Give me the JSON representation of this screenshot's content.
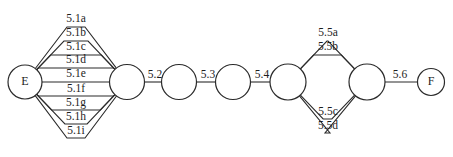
{
  "diagram": {
    "type": "activity-network-diagram",
    "background_color": "#ffffff",
    "line_color": "#2b2b2b",
    "text_color": "#1d1d1d",
    "width": 453,
    "height": 157,
    "nodes": [
      {
        "id": "E",
        "label": "E",
        "cx": 25,
        "cy": 82,
        "r": 17,
        "kind": "terminal"
      },
      {
        "id": "n1",
        "label": "",
        "cx": 127,
        "cy": 82,
        "r": 17.5,
        "kind": "junction"
      },
      {
        "id": "n2",
        "label": "",
        "cx": 179,
        "cy": 82,
        "r": 17.5,
        "kind": "junction"
      },
      {
        "id": "n3",
        "label": "",
        "cx": 233,
        "cy": 82,
        "r": 17.5,
        "kind": "junction"
      },
      {
        "id": "n4",
        "label": "",
        "cx": 288,
        "cy": 82,
        "r": 18,
        "kind": "junction"
      },
      {
        "id": "n5",
        "label": "",
        "cx": 367,
        "cy": 82,
        "r": 18,
        "kind": "junction"
      },
      {
        "id": "F",
        "label": "F",
        "cx": 431,
        "cy": 82,
        "r": 13.5,
        "kind": "terminal"
      }
    ],
    "edge_groups": [
      {
        "name": "group-5-1",
        "from": "E",
        "to": "n1",
        "orientation": "parallel-fan",
        "edges": [
          {
            "label": "5.1a",
            "label_x": 76,
            "label_y": 22,
            "run_y": 27,
            "side": "above"
          },
          {
            "label": "5.1b",
            "label_x": 76,
            "label_y": 36,
            "run_y": 41,
            "side": "above"
          },
          {
            "label": "5.1c",
            "label_x": 76,
            "label_y": 50,
            "run_y": 55,
            "side": "above"
          },
          {
            "label": "5.1d",
            "label_x": 76,
            "label_y": 63,
            "run_y": 68,
            "side": "above"
          },
          {
            "label": "5.1e",
            "label_x": 76,
            "label_y": 77,
            "run_y": 82,
            "side": "center"
          },
          {
            "label": "5.1f",
            "label_x": 76,
            "label_y": 92,
            "run_y": 96,
            "side": "below"
          },
          {
            "label": "5.1g",
            "label_x": 76,
            "label_y": 106,
            "run_y": 110,
            "side": "below"
          },
          {
            "label": "5.1h",
            "label_x": 76,
            "label_y": 120,
            "run_y": 124,
            "side": "below"
          },
          {
            "label": "5.1i",
            "label_x": 76,
            "label_y": 134,
            "run_y": 138,
            "side": "below"
          }
        ]
      },
      {
        "name": "chain-5-2",
        "from": "n1",
        "to": "n2",
        "orientation": "straight",
        "edges": [
          {
            "label": "5.2",
            "label_x": 155,
            "label_y": 78,
            "run_y": 82,
            "side": "center"
          }
        ]
      },
      {
        "name": "chain-5-3",
        "from": "n2",
        "to": "n3",
        "orientation": "straight",
        "edges": [
          {
            "label": "5.3",
            "label_x": 208,
            "label_y": 78,
            "run_y": 82,
            "side": "center"
          }
        ]
      },
      {
        "name": "chain-5-4",
        "from": "n3",
        "to": "n4",
        "orientation": "straight",
        "edges": [
          {
            "label": "5.4",
            "label_x": 262,
            "label_y": 78,
            "run_y": 82,
            "side": "center"
          }
        ]
      },
      {
        "name": "group-5-5",
        "from": "n4",
        "to": "n5",
        "orientation": "parallel-fan",
        "edges": [
          {
            "label": "5.5a",
            "label_x": 328,
            "label_y": 36,
            "run_y": 41,
            "side": "above"
          },
          {
            "label": "5.5b",
            "label_x": 328,
            "label_y": 50,
            "run_y": 55,
            "side": "above"
          },
          {
            "label": "5.5c",
            "label_x": 328,
            "label_y": 115,
            "run_y": 119,
            "side": "below"
          },
          {
            "label": "5.5d",
            "label_x": 328,
            "label_y": 129,
            "run_y": 133,
            "side": "below"
          }
        ]
      },
      {
        "name": "chain-5-6",
        "from": "n5",
        "to": "F",
        "orientation": "straight",
        "edges": [
          {
            "label": "5.6",
            "label_x": 400,
            "label_y": 78,
            "run_y": 82,
            "side": "center"
          }
        ]
      }
    ]
  }
}
